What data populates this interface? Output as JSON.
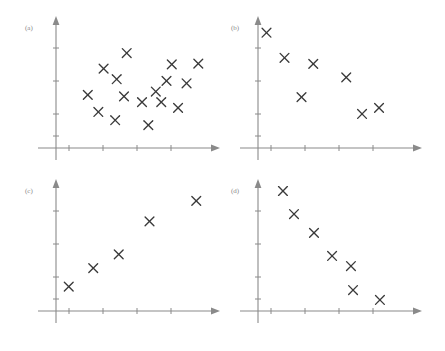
{
  "figure": {
    "width": 445,
    "height": 351,
    "background_color": "#ffffff",
    "axis_color": "#8a8a8a",
    "marker_color": "#3a3a3a",
    "marker_glyph": "x",
    "panel_label_color": "#8a8a8a"
  },
  "chart_data": [
    {
      "type": "scatter",
      "title": "(a)",
      "label": "(a)",
      "xlabel": "",
      "ylabel": "",
      "grid": false,
      "legend": "none",
      "xlim": [
        0,
        10
      ],
      "ylim": [
        0,
        10
      ],
      "x_ticks": [
        2,
        4,
        6,
        8
      ],
      "y_ticks": [
        2,
        4,
        6,
        8
      ],
      "relationship": "no correlation",
      "points": [
        {
          "x": 4.16,
          "y": 7.25
        },
        {
          "x": 2.8,
          "y": 6.06
        },
        {
          "x": 3.57,
          "y": 5.25
        },
        {
          "x": 1.87,
          "y": 4.06
        },
        {
          "x": 4.0,
          "y": 3.94
        },
        {
          "x": 5.06,
          "y": 3.5
        },
        {
          "x": 5.87,
          "y": 4.31
        },
        {
          "x": 2.49,
          "y": 2.75
        },
        {
          "x": 3.48,
          "y": 2.12
        },
        {
          "x": 5.43,
          "y": 1.75
        },
        {
          "x": 6.19,
          "y": 3.5
        },
        {
          "x": 6.5,
          "y": 5.12
        },
        {
          "x": 6.81,
          "y": 6.38
        },
        {
          "x": 7.68,
          "y": 4.94
        },
        {
          "x": 8.37,
          "y": 6.44
        },
        {
          "x": 7.18,
          "y": 3.06
        }
      ]
    },
    {
      "type": "scatter",
      "title": "(b)",
      "label": "(b)",
      "xlabel": "",
      "ylabel": "",
      "grid": false,
      "legend": "none",
      "xlim": [
        0,
        10
      ],
      "ylim": [
        0,
        10
      ],
      "x_ticks": [
        2,
        4,
        6,
        8
      ],
      "y_ticks": [
        2,
        4,
        6,
        8
      ],
      "relationship": "weak negative correlation",
      "points": [
        {
          "x": 0.5,
          "y": 8.06
        },
        {
          "x": 1.56,
          "y": 6.31
        },
        {
          "x": 3.25,
          "y": 5.88
        },
        {
          "x": 5.19,
          "y": 4.94
        },
        {
          "x": 2.56,
          "y": 3.56
        },
        {
          "x": 6.12,
          "y": 2.38
        },
        {
          "x": 7.12,
          "y": 2.81
        }
      ]
    },
    {
      "type": "scatter",
      "title": "(c)",
      "label": "(c)",
      "xlabel": "",
      "ylabel": "",
      "grid": false,
      "legend": "none",
      "xlim": [
        0,
        10
      ],
      "ylim": [
        0,
        10
      ],
      "x_ticks": [
        2,
        4,
        6,
        8
      ],
      "y_ticks": [
        2,
        4,
        6,
        8
      ],
      "relationship": "strong positive correlation",
      "points": [
        {
          "x": 0.75,
          "y": 1.56
        },
        {
          "x": 2.19,
          "y": 2.75
        },
        {
          "x": 3.69,
          "y": 3.63
        },
        {
          "x": 5.5,
          "y": 5.75
        },
        {
          "x": 8.25,
          "y": 7.06
        }
      ]
    },
    {
      "type": "scatter",
      "title": "(d)",
      "label": "(d)",
      "xlabel": "",
      "ylabel": "",
      "grid": false,
      "legend": "none",
      "xlim": [
        0,
        10
      ],
      "ylim": [
        0,
        10
      ],
      "x_ticks": [
        2,
        4,
        6,
        8
      ],
      "y_ticks": [
        2,
        4,
        6,
        8
      ],
      "relationship": "strong negative correlation",
      "points": [
        {
          "x": 1.56,
          "y": 7.5
        },
        {
          "x": 2.25,
          "y": 6.06
        },
        {
          "x": 3.5,
          "y": 4.88
        },
        {
          "x": 4.63,
          "y": 3.44
        },
        {
          "x": 5.81,
          "y": 2.81
        },
        {
          "x": 5.94,
          "y": 1.31
        },
        {
          "x": 7.62,
          "y": 0.69
        }
      ]
    }
  ],
  "panels": {
    "a": {
      "label": "(a)"
    },
    "b": {
      "label": "(b)"
    },
    "c": {
      "label": "(c)"
    },
    "d": {
      "label": "(d)"
    }
  }
}
